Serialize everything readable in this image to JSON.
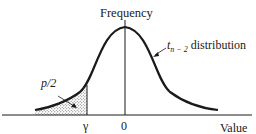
{
  "diagram": {
    "type": "t-distribution-tail-diagram",
    "y_axis_label": "Frequency",
    "x_axis_label": "Value",
    "x_ticks": [
      {
        "label": "γ"
      },
      {
        "label": "0"
      }
    ],
    "curve_label": {
      "prefix": "t",
      "subscript": "n − 2",
      "suffix": " distribution"
    },
    "shaded_region_label": "p/2",
    "colors": {
      "ink": "#1a1a1a",
      "background": "#ffffff"
    }
  }
}
